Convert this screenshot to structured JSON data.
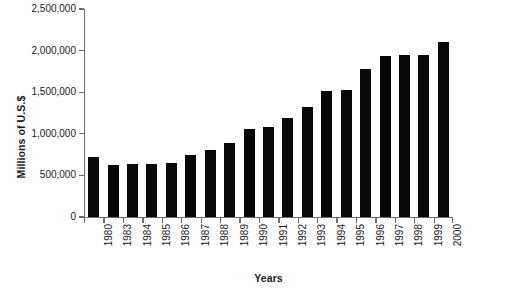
{
  "chart_data": {
    "type": "bar",
    "title": "",
    "xlabel": "Years",
    "ylabel": "Millions of U.S.$",
    "categories": [
      "1980",
      "1983",
      "1984",
      "1985",
      "1986",
      "1987",
      "1988",
      "1989",
      "1990",
      "1991",
      "1992",
      "1993",
      "1994",
      "1995",
      "1996",
      "1997",
      "1998",
      "1999",
      "2000"
    ],
    "values": [
      720000,
      620000,
      640000,
      635000,
      650000,
      740000,
      810000,
      890000,
      1060000,
      1080000,
      1190000,
      1320000,
      1510000,
      1530000,
      1780000,
      1940000,
      1950000,
      1950000,
      2100000
    ],
    "ylim": [
      0,
      2500000
    ],
    "ytick_values": [
      0,
      500000,
      1000000,
      1500000,
      2000000,
      2500000
    ],
    "ytick_labels": [
      "0",
      "500,000",
      "1,000,000",
      "1,500,000",
      "2,000,000",
      "2,500,000"
    ],
    "grid": false,
    "legend": null,
    "bar_color": "#080808",
    "axis_color": "#6b6b6b"
  }
}
